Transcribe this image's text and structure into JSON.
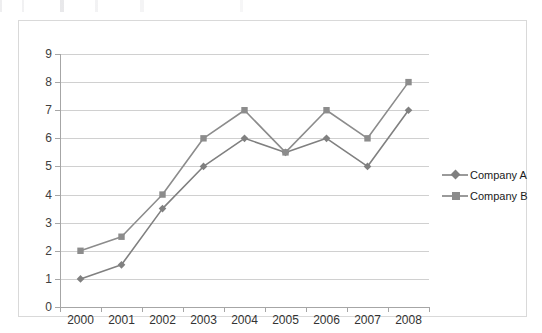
{
  "chart_data": {
    "type": "line",
    "title": "",
    "subtitle": "",
    "xlabel": "",
    "ylabel": "",
    "categories": [
      "2000",
      "2001",
      "2002",
      "2003",
      "2004",
      "2005",
      "2006",
      "2007",
      "2008"
    ],
    "series": [
      {
        "name": "Company A",
        "marker": "diamond",
        "color": "#808080",
        "values": [
          1,
          1.5,
          3.5,
          5,
          6,
          5.5,
          6,
          5,
          7
        ]
      },
      {
        "name": "Company B",
        "marker": "square",
        "color": "#8c8c8c",
        "values": [
          2,
          2.5,
          4,
          6,
          7,
          5.5,
          7,
          6,
          8
        ]
      }
    ],
    "ylim": [
      0,
      9
    ],
    "ytick_step": 1,
    "yticks": [
      "0",
      "1",
      "2",
      "3",
      "4",
      "5",
      "6",
      "7",
      "8",
      "9"
    ],
    "grid": true,
    "grid_axis": "y",
    "legend_position": "right"
  },
  "colors": {
    "series_a": "#808080",
    "series_b": "#8c8c8c",
    "gridline": "#d0d0d0",
    "axis": "#a6a6a6",
    "border": "#d9d9d9",
    "tick_text": "#333333",
    "legend_text": "#1a1a1a",
    "background": "#ffffff"
  }
}
